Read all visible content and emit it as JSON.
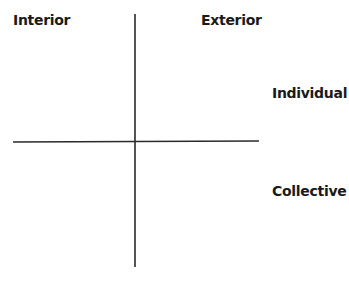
{
  "diagram": {
    "type": "quadrant",
    "labels": {
      "top_left": "Interior",
      "top_right": "Exterior",
      "right_upper": "Individual",
      "right_lower": "Collective"
    },
    "axes": {
      "vertical": {
        "x": 135,
        "y1": 14,
        "y2": 267
      },
      "horizontal": {
        "x1": 13,
        "y1": 142,
        "x2": 259,
        "y2": 141
      }
    },
    "colors": {
      "line": "#2a2a2a",
      "text": "#1a1a1a",
      "background": "#ffffff"
    }
  }
}
